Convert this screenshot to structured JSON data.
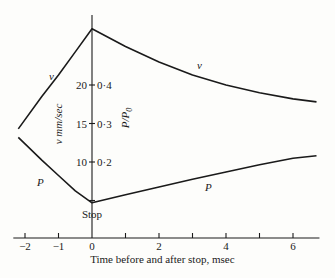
{
  "chart_data": {
    "type": "line",
    "title": "",
    "xlabel": "Time before and after stop, msec",
    "ylabel_left": "v mm/sec",
    "ylabel_right": "P/P0",
    "xlim": [
      -2.2,
      6.7
    ],
    "x_ticks": [
      -2,
      -1,
      0,
      1,
      2,
      3,
      4,
      5,
      6
    ],
    "x_tick_labels": [
      {
        "x": -2,
        "label": "−2"
      },
      {
        "x": -1,
        "label": "−1"
      },
      {
        "x": 0,
        "label": "0"
      },
      {
        "x": 2,
        "label": "2"
      },
      {
        "x": 4,
        "label": "4"
      },
      {
        "x": 6,
        "label": "6"
      }
    ],
    "y_ticks": [
      {
        "v": 20,
        "v_label": "20",
        "p_label": "0·4"
      },
      {
        "v": 15,
        "v_label": "15",
        "p_label": "0·3"
      },
      {
        "v": 10,
        "v_label": "10",
        "p_label": "0·2"
      }
    ],
    "annotation": "Stop",
    "grid": false,
    "series": [
      {
        "name": "v",
        "label": "v",
        "unit": "mm/sec",
        "points": [
          [
            -2.2,
            14.3
          ],
          [
            -1.5,
            18.5
          ],
          [
            -1.0,
            21.3
          ],
          [
            -0.5,
            24.3
          ],
          [
            0,
            27.3
          ],
          [
            1,
            25.0
          ],
          [
            2,
            23.0
          ],
          [
            3,
            21.3
          ],
          [
            4,
            20.0
          ],
          [
            5,
            19.0
          ],
          [
            6,
            18.2
          ],
          [
            6.7,
            17.8
          ]
        ]
      },
      {
        "name": "P",
        "label": "P",
        "unit": "P/P0",
        "points": [
          [
            -2.2,
            0.264
          ],
          [
            -1.5,
            0.205
          ],
          [
            -1.0,
            0.165
          ],
          [
            -0.5,
            0.125
          ],
          [
            0,
            0.094
          ],
          [
            1,
            0.115
          ],
          [
            2,
            0.135
          ],
          [
            3,
            0.155
          ],
          [
            4,
            0.174
          ],
          [
            5,
            0.193
          ],
          [
            6,
            0.21
          ],
          [
            6.7,
            0.216
          ]
        ]
      }
    ]
  }
}
